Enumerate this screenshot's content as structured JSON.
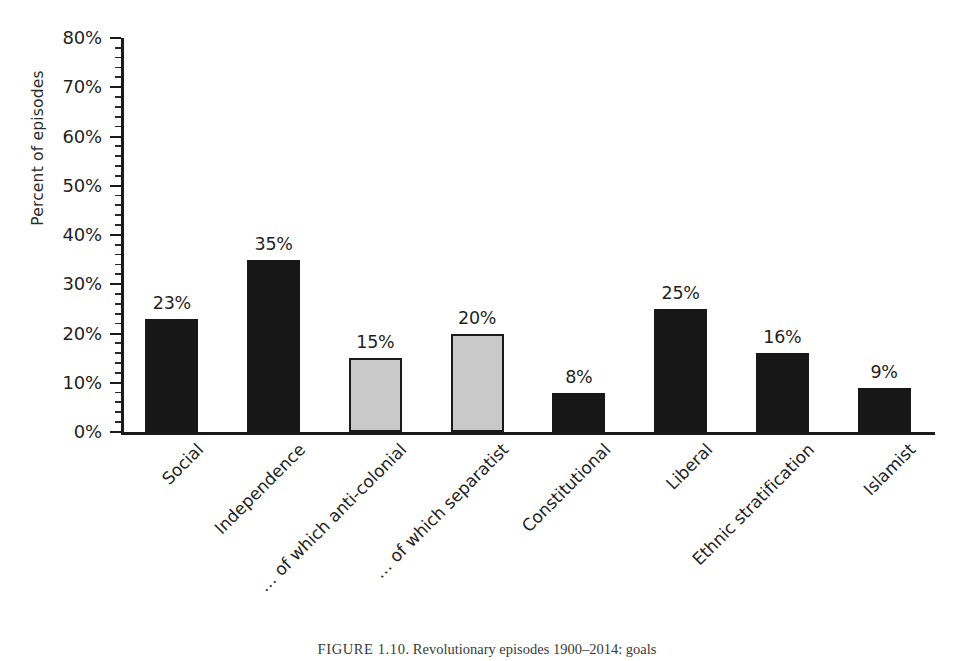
{
  "chart_data": {
    "type": "bar",
    "title": "",
    "xlabel": "",
    "ylabel": "Percent of episodes",
    "ylim": [
      0,
      80
    ],
    "ytick_labels": [
      "80%",
      "70%",
      "60%",
      "50%",
      "40%",
      "30%",
      "20%",
      "10%",
      "0%"
    ],
    "ytick_values": [
      80,
      70,
      60,
      50,
      40,
      30,
      20,
      10,
      0
    ],
    "ytick_step": 10,
    "minor_tick_step": 2,
    "grid": false,
    "legend": "none",
    "categories": [
      "Social",
      "Independence",
      "… of which anti-colonial",
      "… of which separatist",
      "Constitutional",
      "Liberal",
      "Ethnic stratification",
      "Islamist"
    ],
    "values": [
      23,
      35,
      15,
      20,
      8,
      25,
      16,
      9
    ],
    "value_labels": [
      "23%",
      "35%",
      "15%",
      "20%",
      "8%",
      "25%",
      "16%",
      "9%"
    ],
    "bar_styles": [
      "dark",
      "dark",
      "light",
      "light",
      "dark",
      "dark",
      "dark",
      "dark"
    ],
    "colors": {
      "dark_fill": "#171717",
      "light_fill": "#c9c9c9",
      "bar_outline": "#1a1a1a",
      "axis": "#1a1a1a",
      "text": "#1f1f1f"
    }
  },
  "caption": {
    "figure_number": "FIGURE 1.10",
    "separator": ".",
    "text": "Revolutionary episodes 1900–2014: goals"
  }
}
